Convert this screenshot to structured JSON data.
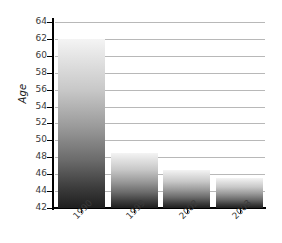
{
  "chart_data": {
    "type": "bar",
    "title": "",
    "xlabel": "",
    "ylabel": "Age",
    "categories": [
      "1990",
      "1999",
      "2002",
      "2003"
    ],
    "values": [
      62.0,
      48.5,
      46.5,
      45.6
    ],
    "ylim": [
      42,
      64
    ],
    "yticks": [
      42,
      44,
      46,
      48,
      50,
      52,
      54,
      56,
      58,
      60,
      62,
      64
    ],
    "ytick_labels": [
      "42",
      "44",
      "46",
      "48",
      "50",
      "52",
      "54",
      "56",
      "58",
      "60",
      "62",
      "64"
    ],
    "grid": true,
    "legend": false,
    "series": [
      {
        "name": "Age",
        "values": [
          62.0,
          48.5,
          46.5,
          45.6
        ]
      }
    ],
    "colors": {
      "bar_gradient_top": "#f4f4f4",
      "bar_gradient_bottom": "#1e1e1e",
      "gridline": "#b8b8b8",
      "axis": "#000000",
      "text": "#3a3a3a",
      "background": "#ffffff"
    }
  }
}
